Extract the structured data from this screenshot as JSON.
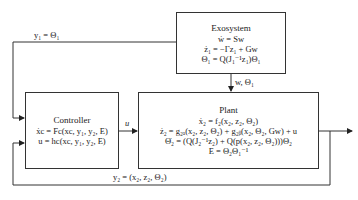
{
  "exosystem": {
    "title": "Exosystem",
    "equations": [
      "ẇ = Sw",
      "ż₁ = −Γz₁ + Gw",
      "Θ₁ = Q(J₁⁻¹z₁)Θ₁"
    ]
  },
  "controller": {
    "title": "Controller",
    "equations": [
      "ẋc = Fc(xc, y₁, y₂, E)",
      "u = hc(xc, y₁, y₂, E)"
    ]
  },
  "plant": {
    "title": "Plant",
    "equations": [
      "ẋ₂ = f₂(x₂, z₂, Θ₂)",
      "ż₂ = g₂ₐ(x₂, z₂, Θ₂) + g₂ᵦ(x₂, Θ₂, Gw) + u",
      "Θ̇₂ = (Q(J₂⁻¹z₂) + Q(p(x₂, z₂, Θ₂)))Θ₂",
      "E = Θ₂Θ₁⁻¹"
    ]
  },
  "signals": {
    "y1": "y₁ = Θ₁",
    "w_theta": "w, Θ₁",
    "u": "u",
    "y2": "y₂ = (x₂, z₂, Θ₂)"
  },
  "colors": {
    "line": "#333333",
    "box_border": "#333333",
    "background": "#ffffff"
  }
}
